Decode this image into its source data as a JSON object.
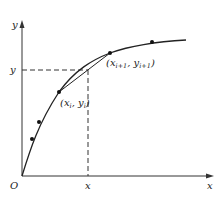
{
  "axes": {
    "origin_label": "O",
    "x_axis_label": "x",
    "y_axis_label": "y",
    "x_marker_label": "x",
    "y_marker_label": "y"
  },
  "points": [
    {
      "id": "p0",
      "cx": 32,
      "cy": 139
    },
    {
      "id": "p1",
      "cx": 39,
      "cy": 122
    },
    {
      "id": "p2",
      "cx": 59,
      "cy": 92
    },
    {
      "id": "p3",
      "cx": 110,
      "cy": 53
    },
    {
      "id": "p4",
      "cx": 152,
      "cy": 42
    }
  ],
  "labels": {
    "point_i": {
      "open": "(x",
      "sub1": "i",
      "comma": ", y",
      "sub2": "i",
      "close": ")"
    },
    "point_i1": {
      "open": "(x",
      "sub1": "i+1",
      "comma": ", y",
      "sub2": "i+1",
      "close": ")"
    }
  },
  "colors": {
    "stroke": "#222222",
    "dash": "#333333"
  }
}
